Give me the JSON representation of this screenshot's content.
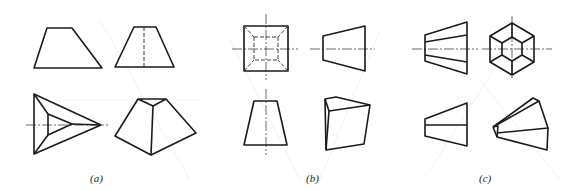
{
  "figure": {
    "panels": [
      {
        "id": "a",
        "caption": "(a)",
        "views": [
          "front-trapezoid",
          "side-trapezoid-with-hidden-edge",
          "top-triangular-frustum",
          "isometric-triangular-frustum"
        ]
      },
      {
        "id": "b",
        "caption": "(b)",
        "views": [
          "front-square-with-hidden-inner-square",
          "side-trapezoid",
          "top-trapezoid",
          "isometric-square-frustum"
        ]
      },
      {
        "id": "c",
        "caption": "(c)",
        "views": [
          "front-trapezoid-with-edges",
          "side-hexagon-frustum",
          "top-trapezoid",
          "isometric-hexagonal-frustum"
        ]
      }
    ]
  }
}
